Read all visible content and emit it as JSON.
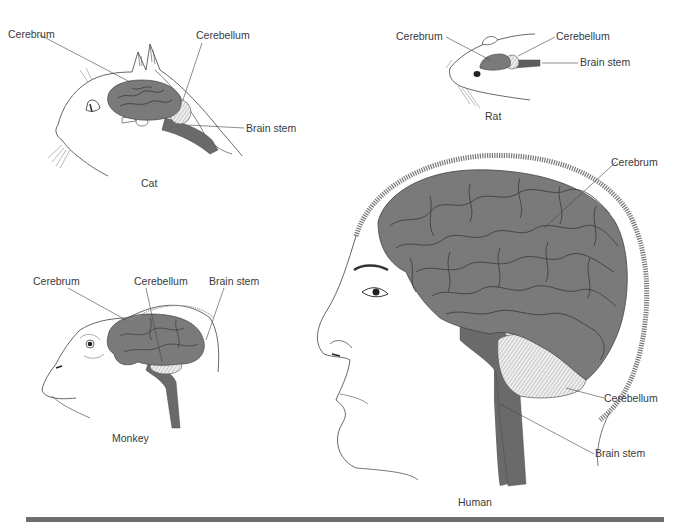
{
  "figure": {
    "colors": {
      "brain_fill": "#7a7a7a",
      "sulci": "#3a3a3a",
      "brainstem": "#6a6a6a",
      "cerebellum_fill": "#eeeeee",
      "outline": "#555555",
      "bottom_rule": "#6e6e6e"
    },
    "panels": [
      {
        "species": "Cat",
        "caption": "Cat",
        "labels": {
          "cerebrum": "Cerebrum",
          "cerebellum": "Cerebellum",
          "brain_stem": "Brain stem"
        }
      },
      {
        "species": "Rat",
        "caption": "Rat",
        "labels": {
          "cerebrum": "Cerebrum",
          "cerebellum": "Cerebellum",
          "brain_stem": "Brain stem"
        }
      },
      {
        "species": "Monkey",
        "caption": "Monkey",
        "labels": {
          "cerebrum": "Cerebrum",
          "cerebellum": "Cerebellum",
          "brain_stem": "Brain stem"
        }
      },
      {
        "species": "Human",
        "caption": "Human",
        "labels": {
          "cerebrum": "Cerebrum",
          "cerebellum": "Cerebellum",
          "brain_stem": "Brain stem"
        }
      }
    ]
  }
}
